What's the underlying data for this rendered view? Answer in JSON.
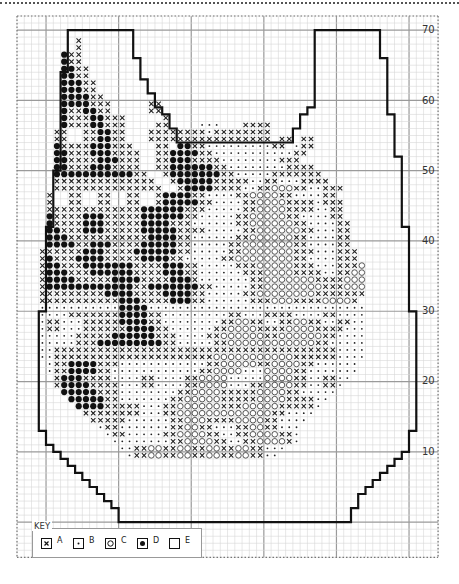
{
  "chart_data": {
    "type": "cross-stitch-chart",
    "title": "",
    "y_axis_labels": [
      "70",
      "60",
      "50",
      "40",
      "30",
      "20",
      "10"
    ],
    "grid": {
      "x0": 17,
      "y0": 16,
      "cell_w": 7.26,
      "cell_h": 7.03,
      "cols": 58,
      "rows": 77,
      "major_every": 10,
      "major_col_offset": 4,
      "major_row_offset": 2
    },
    "outline_cells": [
      [
        7,
        2
      ],
      [
        16,
        2
      ],
      [
        16,
        6
      ],
      [
        17,
        6
      ],
      [
        17,
        9
      ],
      [
        18,
        9
      ],
      [
        18,
        11
      ],
      [
        19,
        11
      ],
      [
        19,
        13
      ],
      [
        20,
        13
      ],
      [
        20,
        14
      ],
      [
        21,
        14
      ],
      [
        21,
        16
      ],
      [
        22,
        16
      ],
      [
        22,
        18
      ],
      [
        38,
        18
      ],
      [
        38,
        16
      ],
      [
        39,
        16
      ],
      [
        39,
        14
      ],
      [
        40,
        14
      ],
      [
        40,
        13
      ],
      [
        41,
        13
      ],
      [
        41,
        6
      ],
      [
        41,
        2
      ],
      [
        50,
        2
      ],
      [
        50,
        6
      ],
      [
        51,
        6
      ],
      [
        51,
        14
      ],
      [
        52,
        14
      ],
      [
        52,
        20
      ],
      [
        53,
        20
      ],
      [
        53,
        30
      ],
      [
        54,
        30
      ],
      [
        54,
        42
      ],
      [
        55,
        42
      ],
      [
        55,
        59
      ],
      [
        54,
        59
      ],
      [
        54,
        62
      ],
      [
        53,
        62
      ],
      [
        53,
        63
      ],
      [
        52,
        63
      ],
      [
        52,
        64
      ],
      [
        51,
        64
      ],
      [
        51,
        65
      ],
      [
        50,
        65
      ],
      [
        50,
        66
      ],
      [
        49,
        66
      ],
      [
        49,
        67
      ],
      [
        48,
        67
      ],
      [
        48,
        68
      ],
      [
        47,
        68
      ],
      [
        47,
        70
      ],
      [
        46,
        70
      ],
      [
        46,
        72
      ],
      [
        14,
        72
      ],
      [
        14,
        70
      ],
      [
        13,
        70
      ],
      [
        13,
        69
      ],
      [
        12,
        69
      ],
      [
        12,
        68
      ],
      [
        11,
        68
      ],
      [
        11,
        67
      ],
      [
        10,
        67
      ],
      [
        10,
        66
      ],
      [
        9,
        66
      ],
      [
        9,
        65
      ],
      [
        8,
        65
      ],
      [
        8,
        64
      ],
      [
        7,
        64
      ],
      [
        7,
        63
      ],
      [
        6,
        63
      ],
      [
        6,
        62
      ],
      [
        5,
        62
      ],
      [
        5,
        61
      ],
      [
        4,
        61
      ],
      [
        4,
        59
      ],
      [
        3,
        59
      ],
      [
        3,
        42
      ],
      [
        4,
        42
      ],
      [
        4,
        30
      ],
      [
        5,
        30
      ],
      [
        5,
        22
      ],
      [
        6,
        22
      ],
      [
        6,
        8
      ],
      [
        7,
        8
      ]
    ],
    "rows_start_col": 3,
    "rows_start_row": 3,
    "stitch_rows": [
      "     A",
      "     A",
      "   DAA",
      "   DAA",
      "   DDAA",
      "   DDAA",
      "   DDDAA",
      "   DDDAA",
      "   DDDDAA",
      "   DDDDAAA     AA",
      "   DAADDAA     AA",
      "   DAAADDAAA     A",
      "   DAAADDAAA    AA    BBB   AAAA",
      "  AA  AADDAA   AAAAAAAABAAAAAAAA",
      "  AA  AADDAA   AAAAAAAAAAAAAAAAA AA AA",
      "  DAAAADDDAAA   AA DDAABBBBBBBBBAA BAA",
      "  DDAAADDDAAAA  AADDDDAABBBBBBBBBBBAA",
      "  DDAAAADDDAAA  AADDDAAAABBBBBBBBAAA",
      "  DDAAADDDAAAA  AADDDDDDAABBBBBBBBAAAA",
      "  DDDDDDDDDDDAA  ADDDDDDDAABBBBBAAAAAAA",
      "  AAAAAAAAAAAAAA  ADDDDDAAAAABBAABBBAAAA",
      "  AAAAAAAAAAAAAAA  ADDDDAAAABBAACCCAABBAAA",
      " A  AA  AA  AA  ADDDDAABBBBAACCCCAABBBBAA",
      " A  AA  AA  AA  ADDDDDAABBBBAACCCCAAAABAAA",
      " AAAAAAAAAAAAADDDDDDAAABBBBBAACCCCAAAABBAA",
      " DAAAADDDAAAAADDDDDDAABBBBBAACCCCCAABBBBAA",
      " DAAAADDDAAAAADDDDAAABBBBBBAACCCCCCAABBBBAA",
      " DDAAADDDAAAAADDDDDAAAABBBBBAACCCCCCAABBBAA",
      " DDDAAAAAAAAAAADDDDAABBBBBBAACCCCCCAABBBBAA",
      " DDDDAADDDAAAADDDDDAABBBBBAACCCCCCCAABBBBAA",
      "AAAAAADDDAAAADDDDDDAABBBBBAACCCCCCCAAABBBAAA",
      "ADAAADDDDAAAAADDDDAABBBBBAACCCCCCCCAABBBBAAA",
      "ADDAAADDDDDDDAAAADDDAABBBBBAAACCCCCAAABBBAAAC",
      "ADDDAAADDDDDDAAAADDDAABBBBBBAAACCCCAAAABBAACC",
      "ADDDDAAAAADDDDAAAADDDABBBBBBBAACCCCCCCAAAACCC",
      "ADDDDDDDDDDDDAADDDDDDDAABBBBBAACCCCCCCCAAACCC",
      "AAAAAAAAADDDDAAAADDDDAABBBBBAACCCCCCCCAAAAAAA",
      "AAAAAAAAAAADDDAAAADDDAABBBBBBAAACCCAAAACCCCA",
      "BBBBBBBBBBBDDDDBBBBBBBBBBBBBBBBBBBBBBBBBBBBBB",
      "BBBBAAAAAAADDDDAABBBBBBBBBAABBBAAAABBBBAABBBB",
      "BAABBBAAAAADDDDAABBBBBBBBAACCAABBAACCAABBAABB",
      "BAABBBAAAAAADDDDAABBBBBBAACCCCAAAACCCCAAAABBB",
      "BBBBBAAAAADDDDDDAAABBBBAACCCCCCAACCCCCCAABBBB",
      "BBBBBAAADDDDDDDDDAABBBBBAACCCCCCCCCCCCAABBBBB",
      "BBAAAAAAAAAAAAAAAAAAAAAAAAAAAAAAAAAAAAAAABBBB",
      "BBAAAAAAAAAAAAAAAAAAAAAACCCCCCCCCCCAAAAAABBBB",
      " BAADDDDAAABBBBBBBBBBBBAACCCCCAACCCCAABBBBBB",
      " BAADDDDAABBBBBBBBBBBBAACCCCBBBCCCCAABBBBBBB",
      "  ADDDAAAABBBBAABBBBAACCCCBBBBBCCCCAABBAABB",
      "  ADDDDAAAABBBAABBBBAACCCCBBBAACCCCAABBAAB",
      "   DDDDDAAABBBBBBBBAACCCCAAAAACCCCAABBBBB",
      "    DDDDDAABBBBBBBAACCCCCAAAAACCCCAAAABB",
      "     DDDDAAAAABBBAACCCCCCAAACCCCCAAAAAB",
      "      AAAAAAAABBBAACCCCCCCCCCCCCAABBBB",
      "       AAAAABBBBBBAACCCAAAACCCCAABBBB",
      "        BAABBBBBBBAACCAABBBAACCAABBB",
      "         BAABBBBBAACCCCAABBAACCCCAAB",
      "          BBBBBBBBAACCCCAABBAACCCCAB",
      "           BBAACCAACCAACCAACCAABBB",
      "            BAACCAACCAACCAACCAABB"
    ],
    "key": [
      {
        "symbol": "A",
        "glyph": "cross",
        "label": "A"
      },
      {
        "symbol": "B",
        "glyph": "dot",
        "label": "B"
      },
      {
        "symbol": "C",
        "glyph": "ring",
        "label": "C"
      },
      {
        "symbol": "D",
        "glyph": "filled-circle",
        "label": "D"
      },
      {
        "symbol": "E",
        "glyph": "blank",
        "label": "E"
      }
    ]
  },
  "key_title": "KEY",
  "key_labels": {
    "a": "A",
    "b": "B",
    "c": "C",
    "d": "D",
    "e": "E"
  },
  "axis": {
    "l70": "70",
    "l60": "60",
    "l50": "50",
    "l40": "40",
    "l30": "30",
    "l20": "20",
    "l10": "10"
  }
}
